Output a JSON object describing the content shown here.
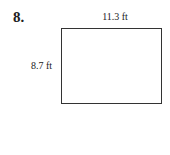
{
  "problem": {
    "number": "8.",
    "shape": "rectangle",
    "width_label": "11.3 ft",
    "height_label": "8.7 ft"
  }
}
